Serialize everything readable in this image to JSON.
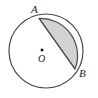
{
  "figure": {
    "kind": "geometry-diagram",
    "background_color": "#ffffff",
    "canvas": {
      "width": 98,
      "height": 98
    }
  },
  "circle": {
    "name": "circle-O",
    "center": {
      "x": 46,
      "y": 51
    },
    "radius": 37,
    "stroke_color": "#4a4a4a",
    "stroke_width": 1.2,
    "fill_color": "#ffffff"
  },
  "center_marker": {
    "name": "center-point-O",
    "x": 42,
    "y": 50,
    "size": 2.6,
    "color": "#141414"
  },
  "points": [
    {
      "id": "A",
      "label": "A",
      "x": 39.2,
      "y": 18.5,
      "label_x": 31,
      "label_y": 4
    },
    {
      "id": "B",
      "label": "B",
      "x": 75.0,
      "y": 69.0,
      "label_x": 79,
      "label_y": 68
    },
    {
      "id": "O",
      "label": "O",
      "x": 42.0,
      "y": 50.0,
      "label_x": 38,
      "label_y": 53
    }
  ],
  "chord": {
    "name": "chord-AB",
    "from": "A",
    "to": "B",
    "x1": 39.2,
    "y1": 18.5,
    "x2": 75.0,
    "y2": 69.0,
    "stroke_color": "#4a4a4a",
    "stroke_width": 1.2
  },
  "shaded_segment": {
    "name": "segment-AB-shaded",
    "between": [
      "A",
      "B"
    ],
    "side": "minor-arc-right",
    "fill_color": "#d2d2d2",
    "stroke_color": "#4a4a4a",
    "stroke_width": 1.2,
    "path": "M 39.2 18.5 A 37 37 0 0 1 75.0 69.0 L 39.2 18.5 Z"
  },
  "labels": {
    "A": "A",
    "B": "B",
    "O": "O"
  }
}
